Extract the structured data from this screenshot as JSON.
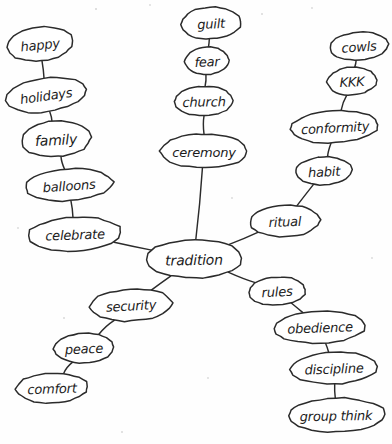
{
  "diagram": {
    "type": "hand-drawn-mind-map",
    "center_node": "tradition",
    "style": {
      "ink_color": "#2b2b2b",
      "paper_color": "#fefefe",
      "node_fill": "#ffffff"
    },
    "nodes": [
      {
        "id": "happy",
        "label": "happy",
        "cx": 40,
        "cy": 44,
        "rx": 33,
        "ry": 17,
        "rot": -6,
        "fs": 13
      },
      {
        "id": "holidays",
        "label": "holidays",
        "cx": 46,
        "cy": 95,
        "rx": 40,
        "ry": 17,
        "rot": -8,
        "fs": 13
      },
      {
        "id": "family",
        "label": "family",
        "cx": 56,
        "cy": 139,
        "rx": 35,
        "ry": 18,
        "rot": -3,
        "fs": 14
      },
      {
        "id": "balloons",
        "label": "balloons",
        "cx": 69,
        "cy": 185,
        "rx": 44,
        "ry": 16,
        "rot": -4,
        "fs": 13
      },
      {
        "id": "celebrate",
        "label": "celebrate",
        "cx": 75,
        "cy": 234,
        "rx": 47,
        "ry": 17,
        "rot": -2,
        "fs": 13
      },
      {
        "id": "guilt",
        "label": "guilt",
        "cx": 211,
        "cy": 23,
        "rx": 30,
        "ry": 16,
        "rot": -3,
        "fs": 13
      },
      {
        "id": "fear",
        "label": "fear",
        "cx": 207,
        "cy": 61,
        "rx": 22,
        "ry": 14,
        "rot": -2,
        "fs": 13
      },
      {
        "id": "church",
        "label": "church",
        "cx": 204,
        "cy": 101,
        "rx": 29,
        "ry": 15,
        "rot": -1,
        "fs": 13
      },
      {
        "id": "ceremony",
        "label": "ceremony",
        "cx": 204,
        "cy": 151,
        "rx": 44,
        "ry": 17,
        "rot": 0,
        "fs": 13
      },
      {
        "id": "cowls",
        "label": "cowls",
        "cx": 359,
        "cy": 46,
        "rx": 29,
        "ry": 14,
        "rot": -4,
        "fs": 13
      },
      {
        "id": "kkk",
        "label": "KKK",
        "cx": 352,
        "cy": 81,
        "rx": 25,
        "ry": 14,
        "rot": -2,
        "fs": 13
      },
      {
        "id": "conformity",
        "label": "conformity",
        "cx": 335,
        "cy": 127,
        "rx": 44,
        "ry": 16,
        "rot": -3,
        "fs": 13
      },
      {
        "id": "habit",
        "label": "habit",
        "cx": 324,
        "cy": 171,
        "rx": 28,
        "ry": 14,
        "rot": -3,
        "fs": 13
      },
      {
        "id": "ritual",
        "label": "ritual",
        "cx": 285,
        "cy": 221,
        "rx": 35,
        "ry": 16,
        "rot": -2,
        "fs": 13
      },
      {
        "id": "tradition",
        "label": "tradition",
        "cx": 194,
        "cy": 259,
        "rx": 49,
        "ry": 19,
        "rot": -1,
        "fs": 14
      },
      {
        "id": "security",
        "label": "security",
        "cx": 131,
        "cy": 305,
        "rx": 41,
        "ry": 16,
        "rot": -3,
        "fs": 13
      },
      {
        "id": "peace",
        "label": "peace",
        "cx": 84,
        "cy": 348,
        "rx": 30,
        "ry": 15,
        "rot": -2,
        "fs": 13
      },
      {
        "id": "comfort",
        "label": "comfort",
        "cx": 52,
        "cy": 388,
        "rx": 36,
        "ry": 15,
        "rot": -2,
        "fs": 13
      },
      {
        "id": "rules",
        "label": "rules",
        "cx": 277,
        "cy": 291,
        "rx": 29,
        "ry": 14,
        "rot": -3,
        "fs": 13
      },
      {
        "id": "obedience",
        "label": "obedience",
        "cx": 320,
        "cy": 327,
        "rx": 46,
        "ry": 16,
        "rot": -2,
        "fs": 13
      },
      {
        "id": "discipline",
        "label": "discipline",
        "cx": 334,
        "cy": 368,
        "rx": 43,
        "ry": 16,
        "rot": -2,
        "fs": 13
      },
      {
        "id": "groupthink",
        "label": "group think",
        "cx": 336,
        "cy": 415,
        "rx": 49,
        "ry": 17,
        "rot": -1,
        "fs": 13
      }
    ],
    "edges": [
      {
        "from": "happy",
        "to": "holidays"
      },
      {
        "from": "holidays",
        "to": "family"
      },
      {
        "from": "family",
        "to": "balloons"
      },
      {
        "from": "balloons",
        "to": "celebrate"
      },
      {
        "from": "celebrate",
        "to": "tradition"
      },
      {
        "from": "guilt",
        "to": "fear"
      },
      {
        "from": "fear",
        "to": "church"
      },
      {
        "from": "church",
        "to": "ceremony"
      },
      {
        "from": "ceremony",
        "to": "tradition"
      },
      {
        "from": "cowls",
        "to": "kkk"
      },
      {
        "from": "kkk",
        "to": "conformity"
      },
      {
        "from": "conformity",
        "to": "habit"
      },
      {
        "from": "habit",
        "to": "ritual"
      },
      {
        "from": "ritual",
        "to": "tradition"
      },
      {
        "from": "tradition",
        "to": "security"
      },
      {
        "from": "security",
        "to": "peace"
      },
      {
        "from": "peace",
        "to": "comfort"
      },
      {
        "from": "tradition",
        "to": "rules"
      },
      {
        "from": "rules",
        "to": "obedience"
      },
      {
        "from": "obedience",
        "to": "discipline"
      },
      {
        "from": "discipline",
        "to": "groupthink"
      }
    ],
    "specks": [
      {
        "cx": 96,
        "cy": 9,
        "r": 1.1
      },
      {
        "cx": 150,
        "cy": 5,
        "r": 0.9
      },
      {
        "cx": 262,
        "cy": 14,
        "r": 1.0
      },
      {
        "cx": 312,
        "cy": 8,
        "r": 0.9
      },
      {
        "cx": 18,
        "cy": 228,
        "r": 0.9
      },
      {
        "cx": 232,
        "cy": 198,
        "r": 0.9
      },
      {
        "cx": 64,
        "cy": 318,
        "r": 1.0
      },
      {
        "cx": 208,
        "cy": 378,
        "r": 0.9
      },
      {
        "cx": 122,
        "cy": 432,
        "r": 1.0
      },
      {
        "cx": 372,
        "cy": 258,
        "r": 0.9
      }
    ]
  }
}
